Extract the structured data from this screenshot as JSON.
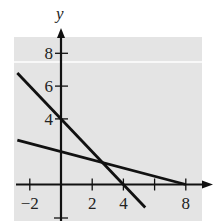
{
  "chart_data": {
    "type": "line",
    "title": "",
    "xlabel": "",
    "ylabel": "y",
    "xlim": [
      -2.8,
      8.5
    ],
    "ylim": [
      -1,
      9
    ],
    "x_ticks": [
      -2,
      2,
      4,
      8
    ],
    "x_minor_ticks": [
      6
    ],
    "y_ticks": [
      4,
      6,
      8
    ],
    "grid": false,
    "background_shading": "#e6e6e6",
    "series": [
      {
        "name": "line-1",
        "equation": "y = -x + 4",
        "x": [
          -2.8,
          5.4
        ],
        "y": [
          6.8,
          -1.4
        ]
      },
      {
        "name": "line-2",
        "equation": "y = -x/4 + 2",
        "x": [
          -2.8,
          8
        ],
        "y": [
          2.7,
          0
        ]
      }
    ]
  },
  "axis": {
    "y_label": "y"
  },
  "ticks": {
    "x": [
      {
        "v": -2,
        "label": "−2"
      },
      {
        "v": 2,
        "label": "2"
      },
      {
        "v": 4,
        "label": "4"
      },
      {
        "v": 6,
        "label": ""
      },
      {
        "v": 8,
        "label": "8"
      }
    ],
    "y": [
      {
        "v": 4,
        "label": "4"
      },
      {
        "v": 6,
        "label": "6"
      },
      {
        "v": 8,
        "label": "8"
      }
    ]
  }
}
